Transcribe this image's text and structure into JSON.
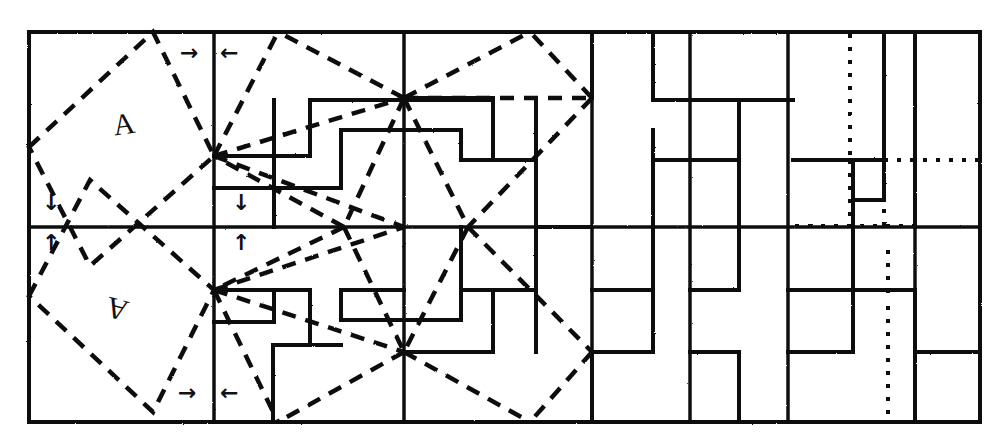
{
  "figure": {
    "ink_color": "#111111",
    "background_color": "#ffffff",
    "frame": {
      "x": 29,
      "y": 32,
      "width": 951,
      "height": 390
    },
    "grid": {
      "horizontal_lines_y": [
        32,
        227,
        422
      ],
      "vertical_lines_x": [
        29,
        214,
        404,
        592,
        690,
        788,
        915,
        980
      ],
      "dotted_vertical_lines_x": [
        850
      ],
      "row_midline_y": 227
    },
    "motifs": [
      {
        "name": "motif-letter-upper",
        "text": "A",
        "x": 113,
        "y": 107,
        "rotation": -8
      },
      {
        "name": "motif-letter-lower",
        "text": "A",
        "x": 106,
        "y": 292,
        "rotation": 195
      }
    ],
    "arrows": [
      {
        "name": "arrow-top-right-pointing",
        "glyph": "→",
        "x": 180,
        "y": 42
      },
      {
        "name": "arrow-top-left-pointing",
        "glyph": "←",
        "x": 220,
        "y": 42
      },
      {
        "name": "arrow-mid-left-down",
        "glyph": "↓",
        "x": 42,
        "y": 192
      },
      {
        "name": "arrow-mid-left-up",
        "glyph": "↑",
        "x": 42,
        "y": 232
      },
      {
        "name": "arrow-mid-center-down",
        "glyph": "↓",
        "x": 232,
        "y": 192
      },
      {
        "name": "arrow-mid-center-up",
        "glyph": "↑",
        "x": 232,
        "y": 232
      },
      {
        "name": "arrow-bottom-right-pointing",
        "glyph": "→",
        "x": 178,
        "y": 382
      },
      {
        "name": "arrow-bottom-left-pointing",
        "glyph": "←",
        "x": 220,
        "y": 382
      }
    ],
    "dashed_construction": {
      "style": "dashed",
      "dash_pattern": "13 9",
      "stroke_width": 4,
      "tilted_square_top": [
        [
          29,
          147
        ],
        [
          153,
          32
        ],
        [
          214,
          156
        ],
        [
          90,
          266
        ]
      ],
      "tilted_square_bottom": [
        [
          29,
          296
        ],
        [
          90,
          180
        ],
        [
          214,
          290
        ],
        [
          153,
          412
        ]
      ],
      "fan_nodes": [
        [
          214,
          156
        ],
        [
          404,
          98
        ],
        [
          214,
          290
        ],
        [
          468,
          227
        ],
        [
          344,
          227
        ],
        [
          404,
          352
        ],
        [
          592,
          98
        ],
        [
          592,
          352
        ]
      ]
    },
    "meander_paths": {
      "style": "solid",
      "stroke_width": 4,
      "description": "Greek-key / meander spiral tiles filling grid cells"
    },
    "legend": {
      "label_dashed": "dashed construction line",
      "label_solid": "meander tile outline",
      "label_dotted": "dotted auxiliary line"
    }
  }
}
